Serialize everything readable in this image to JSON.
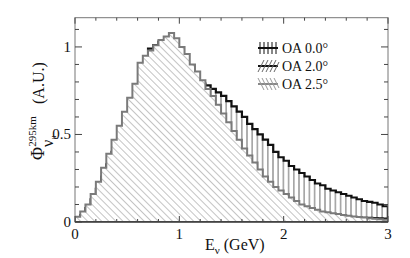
{
  "chart_data": {
    "type": "bar",
    "subtype": "overlaid-step-histogram",
    "title": "",
    "xlabel": "E_ν (GeV)",
    "ylabel": "Φ^{295km}_{ν_μ} (A.U.)",
    "xlim": [
      0,
      3
    ],
    "ylim": [
      0,
      1.167
    ],
    "x_ticks": [
      0,
      1,
      2,
      3
    ],
    "x_tick_labels": [
      "0",
      "1",
      "2",
      "3"
    ],
    "y_ticks": [
      0,
      0.5,
      1
    ],
    "y_tick_labels": [
      "0",
      "0.5",
      "1"
    ],
    "grid": false,
    "legend_position": "upper right",
    "bin_width": 0.05,
    "bin_edges_start": 0,
    "series": [
      {
        "name": "OA 0.0°",
        "hatch": "vertical",
        "line_color": "#111111",
        "line_width": 2.2,
        "values": [
          0.02,
          0.03,
          0.05,
          0.07,
          0.09,
          0.12,
          0.15,
          0.18,
          0.22,
          0.26,
          0.3,
          0.34,
          0.39,
          0.44,
          0.49,
          0.54,
          0.59,
          0.64,
          0.69,
          0.72,
          0.8,
          0.81,
          0.81,
          0.8,
          0.79,
          0.78,
          0.76,
          0.74,
          0.72,
          0.69,
          0.66,
          0.63,
          0.6,
          0.56,
          0.53,
          0.5,
          0.47,
          0.44,
          0.4,
          0.37,
          0.35,
          0.32,
          0.3,
          0.28,
          0.26,
          0.24,
          0.22,
          0.21,
          0.19,
          0.18,
          0.17,
          0.16,
          0.15,
          0.14,
          0.13,
          0.12,
          0.115,
          0.11,
          0.1,
          0.09
        ]
      },
      {
        "name": "OA 2.0°",
        "hatch": "diagonal-up",
        "line_color": "#111111",
        "line_width": 2.2,
        "values": [
          0.02,
          0.04,
          0.08,
          0.13,
          0.19,
          0.26,
          0.33,
          0.4,
          0.46,
          0.52,
          0.58,
          0.63,
          0.68,
          0.78,
          0.99,
          1.01,
          1.03,
          1.0,
          0.93,
          0.78,
          0.62,
          0.46,
          0.36,
          0.3,
          0.26,
          0.22,
          0.19,
          0.16,
          0.14,
          0.12,
          0.11,
          0.1,
          0.09,
          0.085,
          0.08,
          0.075,
          0.07,
          0.065,
          0.06,
          0.055,
          0.05,
          0.048,
          0.045,
          0.043,
          0.04,
          0.038,
          0.036,
          0.034,
          0.032,
          0.03,
          0.029,
          0.028,
          0.027,
          0.026,
          0.025,
          0.024,
          0.023,
          0.022,
          0.021,
          0.02
        ]
      },
      {
        "name": "OA 2.5°",
        "hatch": "diagonal-down",
        "line_color": "#7a7a7a",
        "line_width": 2.0,
        "values": [
          0.03,
          0.06,
          0.1,
          0.16,
          0.23,
          0.31,
          0.39,
          0.47,
          0.55,
          0.63,
          0.71,
          0.79,
          0.91,
          0.95,
          0.98,
          1.01,
          1.04,
          1.06,
          1.08,
          1.05,
          1.0,
          0.96,
          0.9,
          0.86,
          0.81,
          0.76,
          0.72,
          0.67,
          0.62,
          0.57,
          0.52,
          0.47,
          0.42,
          0.38,
          0.34,
          0.3,
          0.26,
          0.23,
          0.2,
          0.18,
          0.16,
          0.14,
          0.12,
          0.1,
          0.09,
          0.08,
          0.07,
          0.06,
          0.055,
          0.05,
          0.045,
          0.04,
          0.036,
          0.032,
          0.028,
          0.025,
          0.022,
          0.019,
          0.016,
          0.013
        ]
      }
    ]
  },
  "axes": {
    "x_title_main": "E",
    "x_title_sub": "ν",
    "x_title_unit": " (GeV)",
    "y_title_main": "Φ",
    "y_title_sup": "295km",
    "y_title_sub": "ν",
    "y_title_subsub": "μ",
    "y_title_unit": " (A.U.)"
  },
  "legend": [
    {
      "label": "OA 0.0°"
    },
    {
      "label": "OA 2.0°"
    },
    {
      "label": "OA 2.5°"
    }
  ]
}
